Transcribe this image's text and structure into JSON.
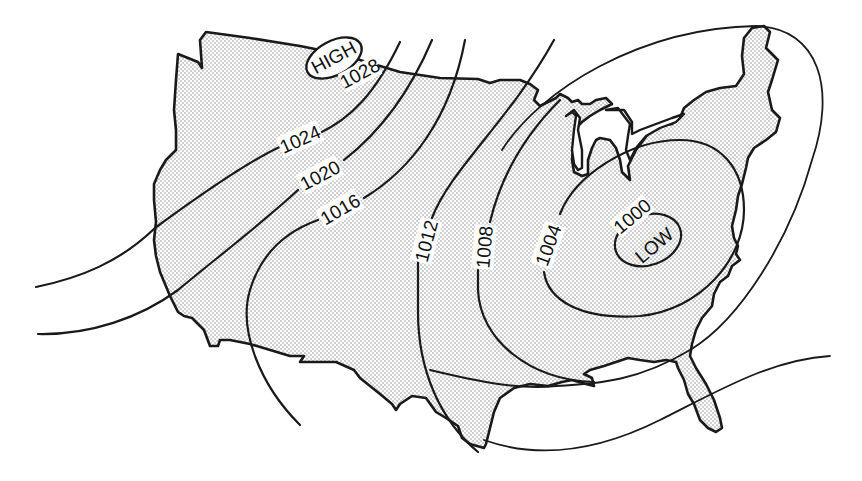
{
  "map": {
    "title": "",
    "region": "Continental United States",
    "fill_pattern": "stipple",
    "colors": {
      "ink": "#1a1a1a",
      "stipple": "#9a9a9a",
      "background": "#ffffff"
    },
    "pressure_centers": [
      {
        "type": "high",
        "label": "HIGH",
        "value": "1028"
      },
      {
        "type": "low",
        "label": "LOW",
        "value": "1000"
      }
    ],
    "isobars": [
      {
        "value": "1028",
        "label": "1028"
      },
      {
        "value": "1024",
        "label": "1024"
      },
      {
        "value": "1020",
        "label": "1020"
      },
      {
        "value": "1016",
        "label": "1016"
      },
      {
        "value": "1012",
        "label": "1012"
      },
      {
        "value": "1008",
        "label": "1008"
      },
      {
        "value": "1004",
        "label": "1004"
      },
      {
        "value": "1000",
        "label": "1000"
      }
    ],
    "units": "millibars"
  }
}
